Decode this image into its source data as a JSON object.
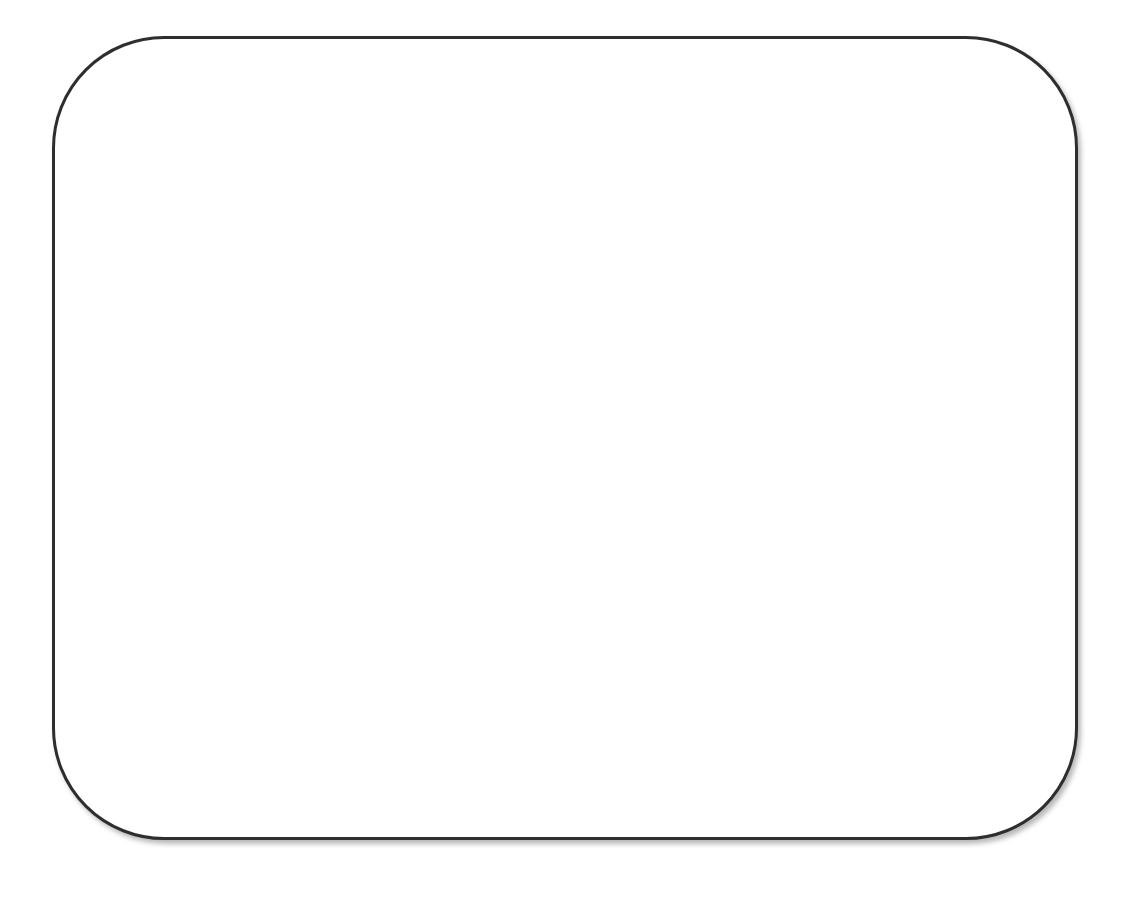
{
  "diagram": {
    "shapes": [
      {
        "type": "rounded-rectangle",
        "label": "",
        "border_color": "#2e2e2e",
        "fill_color": "#ffffff",
        "has_shadow": true
      }
    ]
  }
}
